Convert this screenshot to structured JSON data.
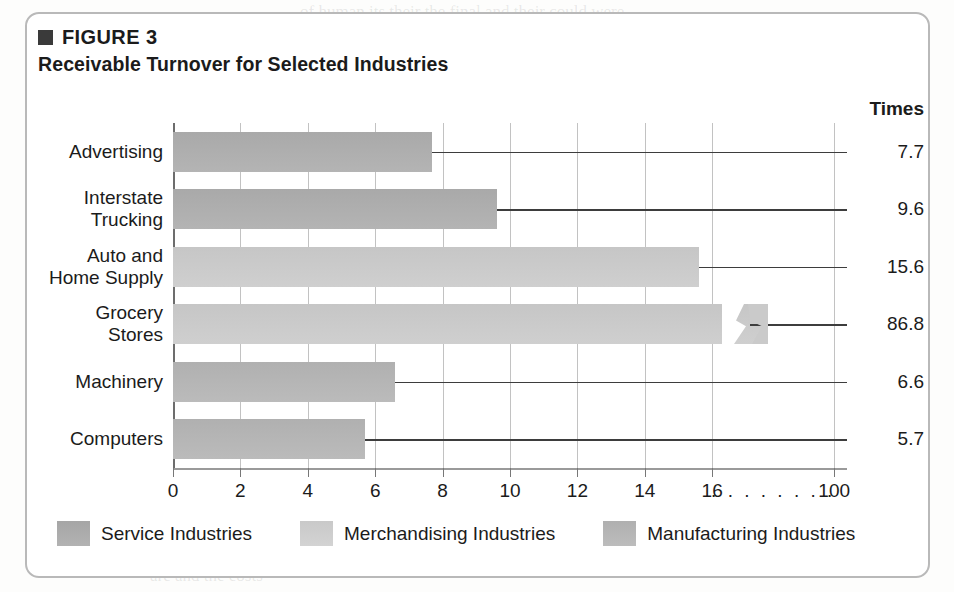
{
  "figure": {
    "label": "FIGURE 3",
    "bullet_icon": "black-square-bullet",
    "title": "Receivable Turnover for Selected Industries"
  },
  "value_column": {
    "header": "Times"
  },
  "legend": {
    "items": [
      {
        "label": "Service Industries",
        "key": "service",
        "color": "#a9a9a9"
      },
      {
        "label": "Merchandising Industries",
        "key": "merch",
        "color": "#cacaca"
      },
      {
        "label": "Manufacturing Industries",
        "key": "manuf",
        "color": "#b3b3b3"
      }
    ]
  },
  "axis": {
    "ticks": [
      "0",
      "2",
      "4",
      "6",
      "8",
      "10",
      "12",
      "14",
      "16",
      "100"
    ],
    "break_marker": "........",
    "break_marker_text": "16 . . . . . . . . 100"
  },
  "ghost_text": {
    "top_right_1": "of human its their the final and their could were",
    "top_right_2": "nine of the whole of our own and a",
    "top_right_3": "over of them. Its and the",
    "bottom_1": "of the allocation and beneath",
    "bottom_2": "are and the costs"
  },
  "chart_data": {
    "type": "bar",
    "orientation": "horizontal",
    "title": "Receivable Turnover for Selected Industries",
    "xlabel": "",
    "ylabel": "",
    "value_axis_label": "Times",
    "grid": true,
    "legend_position": "bottom",
    "xlim": [
      0,
      18
    ],
    "xticks": [
      0,
      2,
      4,
      6,
      8,
      10,
      12,
      14,
      16,
      100
    ],
    "axis_break": {
      "present": true,
      "between": [
        16,
        100
      ],
      "applies_to": "Grocery Stores"
    },
    "categories": [
      "Advertising",
      "Interstate Trucking",
      "Auto and Home Supply",
      "Grocery Stores",
      "Machinery",
      "Computers"
    ],
    "values": [
      7.7,
      9.6,
      15.6,
      86.8,
      6.6,
      5.7
    ],
    "value_labels": [
      "7.7",
      "9.6",
      "15.6",
      "86.8",
      "6.6",
      "5.7"
    ],
    "groups": [
      "Service Industries",
      "Service Industries",
      "Merchandising Industries",
      "Merchandising Industries",
      "Manufacturing Industries",
      "Manufacturing Industries"
    ],
    "series": [
      {
        "name": "Service Industries",
        "key": "service",
        "color": "#a9a9a9",
        "points": [
          {
            "category": "Advertising",
            "value": 7.7
          },
          {
            "category": "Interstate Trucking",
            "value": 9.6
          }
        ]
      },
      {
        "name": "Merchandising Industries",
        "key": "merch",
        "color": "#cacaca",
        "points": [
          {
            "category": "Auto and Home Supply",
            "value": 15.6
          },
          {
            "category": "Grocery Stores",
            "value": 86.8
          }
        ]
      },
      {
        "name": "Manufacturing Industries",
        "key": "manuf",
        "color": "#b3b3b3",
        "points": [
          {
            "category": "Machinery",
            "value": 6.6
          },
          {
            "category": "Computers",
            "value": 5.7
          }
        ]
      }
    ],
    "rows": [
      {
        "category": "Advertising",
        "label_lines": "Advertising",
        "value": 7.7,
        "value_label": "7.7",
        "series": "service"
      },
      {
        "category": "Interstate Trucking",
        "label_lines": "Interstate\nTrucking",
        "value": 9.6,
        "value_label": "9.6",
        "series": "service"
      },
      {
        "category": "Auto and Home Supply",
        "label_lines": "Auto and\nHome Supply",
        "value": 15.6,
        "value_label": "15.6",
        "series": "merch"
      },
      {
        "category": "Grocery Stores",
        "label_lines": "Grocery\nStores",
        "value": 86.8,
        "value_label": "86.8",
        "series": "merch"
      },
      {
        "category": "Machinery",
        "label_lines": "Machinery",
        "value": 6.6,
        "value_label": "6.6",
        "series": "manuf"
      },
      {
        "category": "Computers",
        "label_lines": "Computers",
        "value": 5.7,
        "value_label": "5.7",
        "series": "manuf"
      }
    ]
  }
}
